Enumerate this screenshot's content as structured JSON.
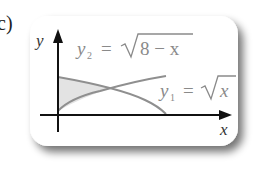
{
  "part_label": "c)",
  "axes": {
    "x_label": "x",
    "y_label": "y"
  },
  "curves": [
    {
      "name": "y2",
      "label_var": "y",
      "label_sub": "2",
      "label_expr": "8 − x",
      "equation": "y2 = √(8 − x)"
    },
    {
      "name": "y1",
      "label_var": "y",
      "label_sub": "1",
      "label_expr": "x",
      "equation": "y1 = √x"
    }
  ],
  "colors": {
    "curve": "#8f8f8f",
    "shade": "#e3e3e3",
    "axis": "#111111",
    "card_shadow": "#9a9a9a"
  }
}
